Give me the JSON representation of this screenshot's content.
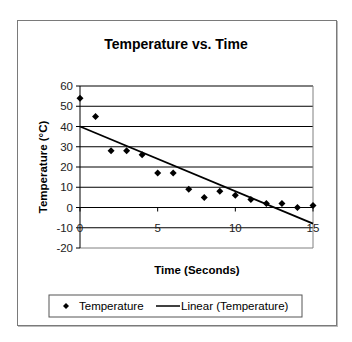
{
  "chart_data": {
    "type": "scatter",
    "title": "Temperature vs. Time",
    "xlabel": "Time (Seconds)",
    "ylabel": "Temperature (°C)",
    "xlim": [
      0,
      15
    ],
    "ylim": [
      -20,
      60
    ],
    "x_ticks": [
      0,
      5,
      10,
      15
    ],
    "y_ticks": [
      -20,
      -10,
      0,
      10,
      20,
      30,
      40,
      50,
      60
    ],
    "grid": "horizontal major gridlines",
    "legend_position": "bottom",
    "series": [
      {
        "name": "Temperature",
        "marker": "diamond",
        "x": [
          0,
          1,
          2,
          3,
          4,
          5,
          6,
          7,
          8,
          9,
          10,
          11,
          12,
          13,
          14,
          15
        ],
        "y": [
          54,
          45,
          28,
          28,
          26,
          17,
          17,
          9,
          5,
          8,
          6,
          4,
          2,
          2,
          0,
          1
        ]
      },
      {
        "name": "Linear (Temperature)",
        "type": "line",
        "x": [
          0,
          15
        ],
        "y": [
          40,
          -8
        ]
      }
    ]
  },
  "legend": {
    "series_label": "Temperature",
    "trend_label": "Linear (Temperature)"
  },
  "tick_labels": {
    "y": [
      "60",
      "50",
      "40",
      "30",
      "20",
      "10",
      "0",
      "-10",
      "-20"
    ],
    "x": [
      "0",
      "5",
      "10",
      "15"
    ]
  }
}
